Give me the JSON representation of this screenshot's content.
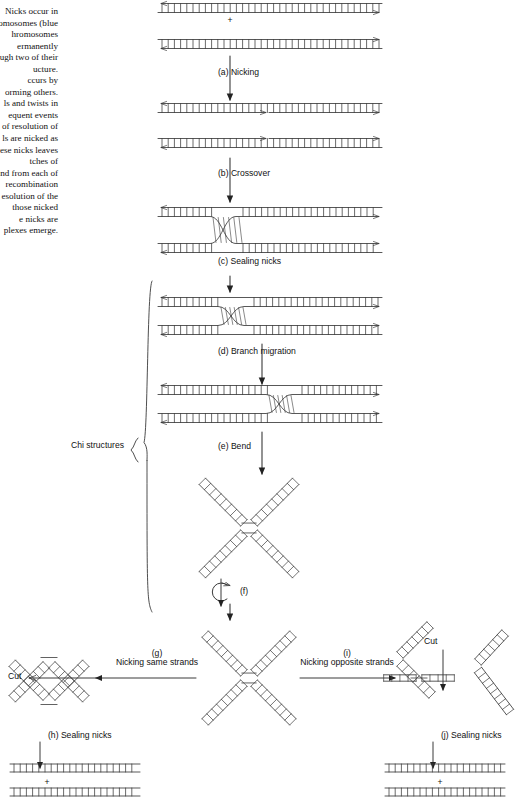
{
  "figure": {
    "caption_text": "Nicks occur in chromosomes (blue chromosomes permanently ugh two of their ucture. ccurs by orming others. ls and twists in equent events l of resolution of ls are nicked as ese nicks leaves tches of and from each of recombination esolution of the those nicked e nicks are plexes emerge.",
    "caption_lines": [
      "Nicks occur in",
      "romosomes (blue",
      "hromosomes",
      "ermanently",
      "ugh two of their",
      "ucture.",
      "ccurs by",
      "orming others.",
      "ls and twists in",
      "equent events",
      "l of resolution of",
      "ls are nicked as",
      "ese nicks leaves",
      "tches of",
      "and from each of",
      "recombination",
      "esolution of the",
      "those nicked",
      "e nicks are",
      "plexes emerge."
    ]
  },
  "steps": {
    "a": "(a) Nicking",
    "b": "(b) Crossover",
    "c": "(c) Sealing nicks",
    "d": "(d) Branch migration",
    "e": "(e) Bend",
    "f": "(f)",
    "g_tag": "(g)",
    "g": "Nicking same strands",
    "h": "(h) Sealing nicks",
    "i_tag": "(i)",
    "i": "Nicking opposite strands",
    "j": "(j) Sealing nicks"
  },
  "annotations": {
    "chi_structures": "Chi structures",
    "cut_left": "Cut",
    "cut_right": "Cut",
    "plus_top": "+",
    "plus_bottom_left": "+",
    "plus_bottom_right": "+"
  },
  "colors": {
    "stroke": "#3a3a3a",
    "text": "#111111",
    "background": "#ffffff"
  }
}
